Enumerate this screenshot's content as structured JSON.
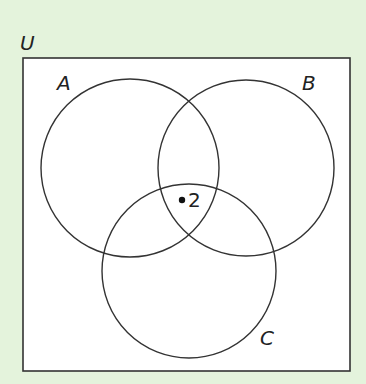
{
  "diagram": {
    "type": "venn",
    "universal_label": "U",
    "sets": [
      {
        "label": "A",
        "cx": 130,
        "cy": 168,
        "r": 89
      },
      {
        "label": "B",
        "cx": 246,
        "cy": 168,
        "r": 88
      },
      {
        "label": "C",
        "cx": 189,
        "cy": 271,
        "r": 87
      }
    ],
    "elements": [
      {
        "value": "2",
        "region": "A∩B∩C"
      }
    ],
    "colors": {
      "background": "#e4f3dc",
      "box_fill": "#ffffff",
      "stroke": "#333333"
    }
  }
}
